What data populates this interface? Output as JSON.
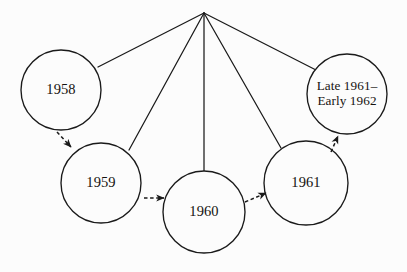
{
  "diagram": {
    "type": "radial-timeline-diagram",
    "background_color": "#fcfcfc",
    "stroke_color": "#1a1a1a",
    "text_color": "#15120f",
    "apex": {
      "name": "convergence-point",
      "x": 204,
      "y": 13
    },
    "nodes": [
      {
        "id": "node-1958",
        "label": "1958",
        "lines": [
          "1958"
        ],
        "cx": 61,
        "cy": 90,
        "r": 40
      },
      {
        "id": "node-1959",
        "label": "1959",
        "lines": [
          "1959"
        ],
        "cx": 101,
        "cy": 183,
        "r": 40
      },
      {
        "id": "node-1960",
        "label": "1960",
        "lines": [
          "1960"
        ],
        "cx": 204,
        "cy": 212,
        "r": 41
      },
      {
        "id": "node-1961",
        "label": "1961",
        "lines": [
          "1961"
        ],
        "cx": 306,
        "cy": 183,
        "r": 42
      },
      {
        "id": "node-late-1961-early-1962",
        "label": "Late 1961– Early 1962",
        "lines": [
          "Late 1961–",
          "Early 1962"
        ],
        "cx": 347,
        "cy": 94,
        "r": 40
      }
    ],
    "spokes": [
      {
        "name": "spoke-to-1958",
        "x1": 204,
        "y1": 13,
        "x2": 98,
        "y2": 67
      },
      {
        "name": "spoke-to-1959",
        "x1": 204,
        "y1": 13,
        "x2": 129,
        "y2": 150
      },
      {
        "name": "spoke-to-1960",
        "x1": 204,
        "y1": 13,
        "x2": 204,
        "y2": 171
      },
      {
        "name": "spoke-to-1961",
        "x1": 204,
        "y1": 13,
        "x2": 281,
        "y2": 148
      },
      {
        "name": "spoke-to-late-1961",
        "x1": 204,
        "y1": 13,
        "x2": 316,
        "y2": 70
      }
    ],
    "arrows": [
      {
        "name": "arrow-1958-to-1959",
        "x1": 57,
        "y1": 132,
        "x2": 71,
        "y2": 147
      },
      {
        "name": "arrow-1959-to-1960",
        "x1": 144,
        "y1": 198,
        "x2": 164,
        "y2": 198
      },
      {
        "name": "arrow-1960-to-1961",
        "x1": 245,
        "y1": 202,
        "x2": 266,
        "y2": 193
      },
      {
        "name": "arrow-1961-to-late-1961",
        "x1": 331,
        "y1": 152,
        "x2": 338,
        "y2": 136
      }
    ]
  }
}
